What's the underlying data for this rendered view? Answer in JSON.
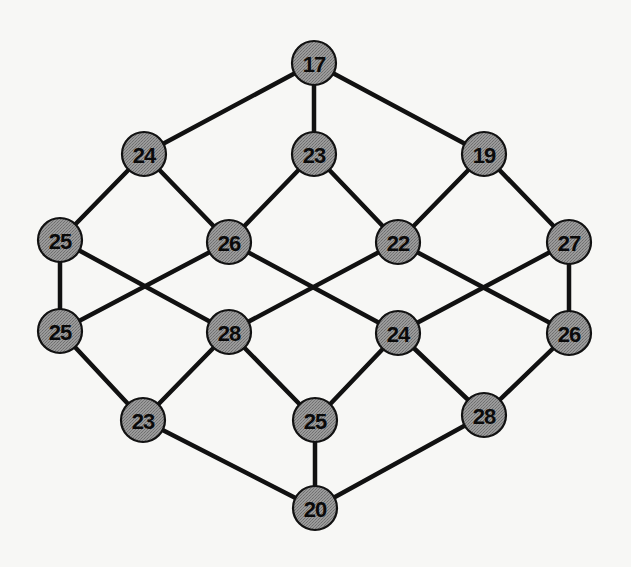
{
  "diagram": {
    "type": "graph",
    "colors": {
      "node_fill": "#8f8f8f",
      "node_stroke": "#111111",
      "edge": "#111111",
      "label": "#0a0a0a",
      "background": "#f7f7f5"
    },
    "node_radius": 22,
    "nodes": [
      {
        "id": "n0",
        "label": "17",
        "x": 314,
        "y": 63
      },
      {
        "id": "n1",
        "label": "24",
        "x": 144,
        "y": 154
      },
      {
        "id": "n2",
        "label": "23",
        "x": 314,
        "y": 154
      },
      {
        "id": "n3",
        "label": "19",
        "x": 484,
        "y": 154
      },
      {
        "id": "n4",
        "label": "25",
        "x": 60,
        "y": 240
      },
      {
        "id": "n5",
        "label": "26",
        "x": 229,
        "y": 242
      },
      {
        "id": "n6",
        "label": "22",
        "x": 398,
        "y": 242
      },
      {
        "id": "n7",
        "label": "27",
        "x": 569,
        "y": 242
      },
      {
        "id": "n8",
        "label": "25",
        "x": 60,
        "y": 331
      },
      {
        "id": "n9",
        "label": "28",
        "x": 229,
        "y": 332
      },
      {
        "id": "n10",
        "label": "24",
        "x": 398,
        "y": 333
      },
      {
        "id": "n11",
        "label": "26",
        "x": 569,
        "y": 333
      },
      {
        "id": "n12",
        "label": "23",
        "x": 143,
        "y": 420
      },
      {
        "id": "n13",
        "label": "25",
        "x": 315,
        "y": 420
      },
      {
        "id": "n14",
        "label": "28",
        "x": 484,
        "y": 415
      },
      {
        "id": "n15",
        "label": "20",
        "x": 315,
        "y": 508
      }
    ],
    "edges": [
      [
        "n0",
        "n1"
      ],
      [
        "n0",
        "n2"
      ],
      [
        "n0",
        "n3"
      ],
      [
        "n1",
        "n4"
      ],
      [
        "n1",
        "n5"
      ],
      [
        "n2",
        "n5"
      ],
      [
        "n2",
        "n6"
      ],
      [
        "n3",
        "n6"
      ],
      [
        "n3",
        "n7"
      ],
      [
        "n4",
        "n8"
      ],
      [
        "n4",
        "n9"
      ],
      [
        "n5",
        "n8"
      ],
      [
        "n5",
        "n10"
      ],
      [
        "n6",
        "n9"
      ],
      [
        "n6",
        "n11"
      ],
      [
        "n7",
        "n10"
      ],
      [
        "n7",
        "n11"
      ],
      [
        "n8",
        "n12"
      ],
      [
        "n9",
        "n12"
      ],
      [
        "n9",
        "n13"
      ],
      [
        "n10",
        "n13"
      ],
      [
        "n10",
        "n14"
      ],
      [
        "n11",
        "n14"
      ],
      [
        "n12",
        "n15"
      ],
      [
        "n13",
        "n15"
      ],
      [
        "n14",
        "n15"
      ]
    ]
  }
}
